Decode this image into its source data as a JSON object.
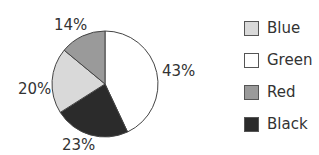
{
  "chart_data": {
    "type": "pie",
    "title": "",
    "categories": [
      "Green",
      "Black",
      "Blue",
      "Red"
    ],
    "values": [
      43,
      23,
      20,
      14
    ],
    "labels": [
      "43%",
      "23%",
      "20%",
      "14%"
    ],
    "colors": [
      "#ffffff",
      "#2b2b2b",
      "#d9d9d9",
      "#9a9a9a"
    ],
    "start_angle": "12 o'clock",
    "direction": "clockwise",
    "legend_position": "right"
  },
  "legend": {
    "items": [
      {
        "label": "Blue",
        "color": "#d9d9d9"
      },
      {
        "label": "Green",
        "color": "#ffffff"
      },
      {
        "label": "Red",
        "color": "#9a9a9a"
      },
      {
        "label": "Black",
        "color": "#2b2b2b"
      }
    ]
  }
}
